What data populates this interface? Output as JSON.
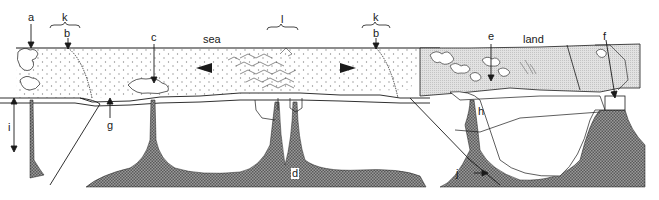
{
  "diagram": {
    "type": "geological-cross-section",
    "colors": {
      "ink": "#1a1a1a",
      "mantle_hatch": "#6e6e6e",
      "dot_fill": "#8a8a8a",
      "land_fill": "#d6d6d6",
      "background": "#ffffff"
    },
    "words": {
      "sea": "sea",
      "land": "land"
    },
    "labels": {
      "a": "a",
      "b_left": "b",
      "b_right": "b",
      "k_left": "k",
      "k_right": "k",
      "l": "l",
      "c": "c",
      "d": "d",
      "e": "e",
      "f": "f",
      "g": "g",
      "h": "h",
      "i": "i",
      "j": "j"
    },
    "arrows": {
      "left_spreading": "left-pointing triangle",
      "right_spreading": "right-pointing triangle"
    }
  }
}
